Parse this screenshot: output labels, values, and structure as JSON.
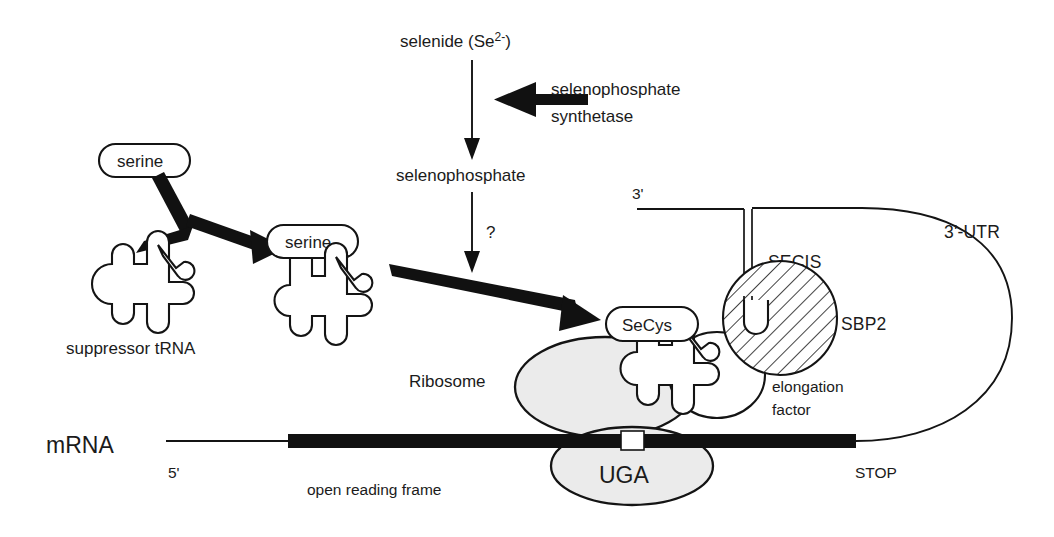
{
  "figure": {
    "background": "#ffffff",
    "ink_color": "#141414",
    "ribosome_fill": "#ebebeb"
  },
  "labels": {
    "selenide": "selenide (Se",
    "selenide_sup": "2-",
    "selenide_close": ")",
    "selenophosphate_synthetase_line1": "selenophosphate",
    "selenophosphate_synthetase_line2": "synthetase",
    "selenophosphate": "selenophosphate",
    "question_mark": "?",
    "serine_1": "serine",
    "serine_2": "serine",
    "suppressor_trna": "suppressor tRNA",
    "secys": "SeCys",
    "secis": "SECIS",
    "sbp2": "SBP2",
    "three_prime": "3'",
    "three_prime_utr": "3'-UTR",
    "elongation_factor_line1": "elongation",
    "elongation_factor_line2": "factor",
    "ribosome": "Ribosome",
    "mrna": "mRNA",
    "five_prime": "5'",
    "open_reading_frame": "open reading frame",
    "uga": "UGA",
    "stop": "STOP"
  }
}
